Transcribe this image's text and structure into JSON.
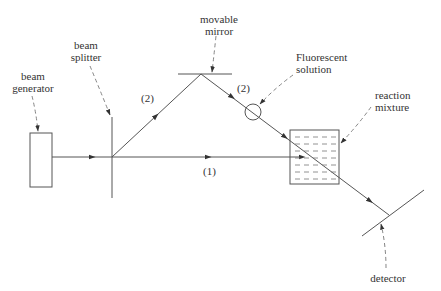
{
  "diagram": {
    "labels": {
      "beam_generator": [
        "beam",
        "generator"
      ],
      "beam_splitter": [
        "beam",
        "splitter"
      ],
      "movable_mirror": [
        "movable",
        "mirror"
      ],
      "fluorescent_solution": [
        "Fluorescent",
        "solution"
      ],
      "reaction_mixture": [
        "reaction",
        "mixture"
      ],
      "detector": "detector",
      "path_1": "(1)",
      "path_2_left": "(2)",
      "path_2_right": "(2)"
    },
    "colors": {
      "line": "#555555",
      "dashed": "#777777",
      "text": "#333333",
      "background": "#ffffff"
    }
  }
}
